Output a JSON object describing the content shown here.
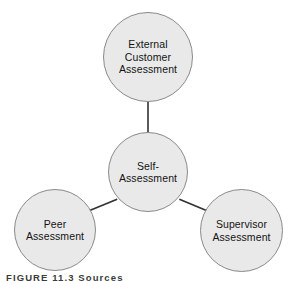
{
  "diagram": {
    "type": "hub-and-spoke",
    "colors": {
      "node_fill": "#e9e9e9",
      "node_stroke": "#8a8a8a",
      "connector": "#333333",
      "text": "#141414",
      "background": "#ffffff"
    },
    "nodes": [
      {
        "id": "external",
        "label": "External\nCustomer\nAssessment",
        "role": "spoke",
        "cx": 148,
        "cy": 57,
        "diameter": 90
      },
      {
        "id": "self",
        "label": "Self-\nAssessment",
        "role": "hub",
        "cx": 148,
        "cy": 172,
        "diameter": 80
      },
      {
        "id": "peer",
        "label": "Peer\nAssessment",
        "role": "spoke",
        "cx": 55,
        "cy": 230,
        "diameter": 82
      },
      {
        "id": "supervisor",
        "label": "Supervisor\nAssessment",
        "role": "spoke",
        "cx": 241,
        "cy": 230,
        "diameter": 83
      }
    ],
    "connectors": [
      {
        "id": "self-external",
        "from": "self",
        "to": "external"
      },
      {
        "id": "self-peer",
        "from": "self",
        "to": "peer"
      },
      {
        "id": "self-supervisor",
        "from": "self",
        "to": "supervisor"
      }
    ],
    "caption": "FIGURE 11.3 Sources"
  }
}
